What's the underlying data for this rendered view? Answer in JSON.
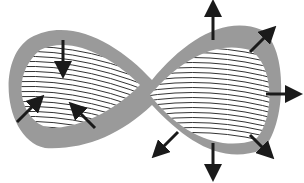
{
  "diagram": {
    "type": "figure-eight with inward and outward force arrows",
    "colors": {
      "band": "#9a9a9a",
      "hatch": "#333333",
      "arrow": "#1a1a1a",
      "background": "#ffffff"
    },
    "left_lobe": {
      "arrows": [
        "down",
        "up-right",
        "up-left"
      ],
      "direction": "inward"
    },
    "right_lobe": {
      "arrows": [
        "up",
        "up-right",
        "right",
        "down-right",
        "down",
        "down-left"
      ],
      "direction": "outward"
    }
  }
}
